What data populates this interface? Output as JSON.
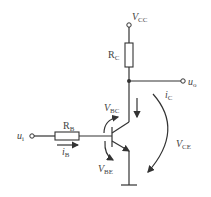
{
  "diagram": {
    "type": "transistor-common-emitter-circuit",
    "components": {
      "supply": {
        "label": "V",
        "subscript": "CC"
      },
      "collector_resistor": {
        "label": "R",
        "subscript": "C"
      },
      "base_resistor": {
        "label": "R",
        "subscript": "B"
      },
      "input": {
        "label": "u",
        "subscript": "i"
      },
      "output": {
        "label": "u",
        "subscript": "o"
      }
    },
    "currents": {
      "base": {
        "label": "i",
        "subscript": "B"
      },
      "collector": {
        "label": "i",
        "subscript": "C"
      }
    },
    "voltages": {
      "bc": {
        "label": "V",
        "subscript": "BC"
      },
      "be": {
        "label": "V",
        "subscript": "BE"
      },
      "ce": {
        "label": "V",
        "subscript": "CE"
      }
    },
    "colors": {
      "line": "#333333",
      "text": "#444444",
      "background": "#ffffff"
    }
  }
}
